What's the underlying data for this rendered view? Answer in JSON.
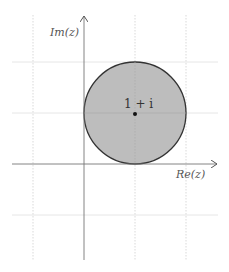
{
  "diagram": {
    "axes": {
      "x_label": "Re(z)",
      "y_label": "Im(z)"
    },
    "grid": {
      "x_positions": [
        33,
        84,
        135,
        186
      ],
      "y_positions": [
        62,
        113,
        164,
        215
      ],
      "style": "dotted",
      "color": "#cccccc"
    },
    "circle": {
      "center_label": "1 + i",
      "center": [
        1,
        1
      ],
      "radius": 1,
      "fill": "#bdbdbd",
      "stroke": "#333333"
    }
  }
}
